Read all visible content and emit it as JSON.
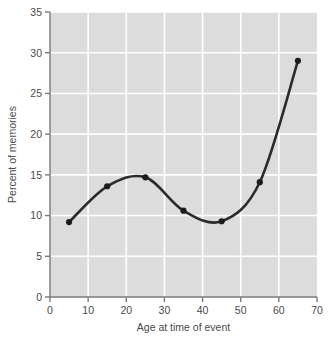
{
  "chart_data": {
    "type": "line",
    "title": "",
    "xlabel": "Age at time of event",
    "ylabel": "Percent of memories",
    "xlim": [
      0,
      70
    ],
    "ylim": [
      0,
      35
    ],
    "xticks": [
      0,
      10,
      20,
      30,
      40,
      50,
      60,
      70
    ],
    "yticks": [
      0,
      5,
      10,
      15,
      20,
      25,
      30,
      35
    ],
    "xtick_labels": [
      "0",
      "10",
      "20",
      "30",
      "40",
      "50",
      "60",
      "70"
    ],
    "ytick_labels": [
      "0",
      "5",
      "10",
      "15",
      "20",
      "25",
      "30",
      "35"
    ],
    "grid": true,
    "grid_color": "#ffffff",
    "plot_background": "#dcdcdc",
    "page_background": "#ffffff",
    "line_color": "#2b2b2b",
    "marker_color": "#1c1c1c",
    "legend": null,
    "x": [
      5,
      15,
      25,
      35,
      45,
      55,
      65
    ],
    "values": [
      9.2,
      13.6,
      14.7,
      10.6,
      9.3,
      14.1,
      29.0
    ],
    "series": [
      {
        "name": "Percent of memories",
        "x": [
          5,
          15,
          25,
          35,
          45,
          55,
          65
        ],
        "values": [
          9.2,
          13.6,
          14.7,
          10.6,
          9.3,
          14.1,
          29.0
        ]
      }
    ],
    "annotations": []
  }
}
